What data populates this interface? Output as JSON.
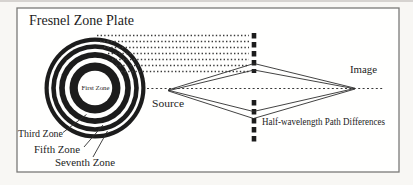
{
  "figure": {
    "title": "Fresnel Zone Plate",
    "zone_plate": {
      "first_zone_label": "First Zone",
      "third_zone_label": "Third Zone",
      "fifth_zone_label": "Fifth Zone",
      "seventh_zone_label": "Seventh Zone"
    },
    "ray_diagram": {
      "source_label": "Source",
      "image_label": "Image",
      "path_difference_label": "Half-wavelength Path Differences"
    },
    "colors": {
      "ink": "#1c1c1c",
      "frame_border": "#7a7a78",
      "background": "#f8f7f4"
    }
  }
}
